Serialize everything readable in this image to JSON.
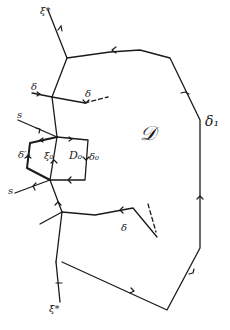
{
  "diagram": {
    "colors": {
      "ink": "#1a1a1a",
      "background": "#ffffff"
    },
    "labels": {
      "xi_star_top": "ξ*",
      "xi_star_bottom": "ξ̄*",
      "region_D": "𝒟",
      "region_D0": "D₀",
      "delta_1": "δ₁",
      "delta_top": "δ",
      "delta_bottom": "δ",
      "delta_left": "δ",
      "delta_0": "δ₀",
      "delta_0_prime": "δ′₀",
      "xi_0": "ξ₀",
      "s_top": "s",
      "s_bottom": "s"
    }
  }
}
